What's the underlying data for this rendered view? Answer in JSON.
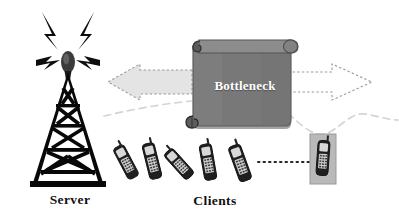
{
  "diagram": {
    "background_color": "#ffffff",
    "width": 399,
    "height": 216,
    "labels": {
      "server": "Server",
      "clients": "Clients",
      "bottleneck": "Bottleneck"
    },
    "colors": {
      "ink": "#101010",
      "scroll_fill": "#787878",
      "scroll_edge": "#606060",
      "scroll_roll": "#8a8a8a",
      "arrow_fill": "#e2e2e2",
      "arrow_stroke": "#8d8d8d",
      "arrow_open_fill": "#ffffff",
      "wave_line": "#d2d2d2",
      "dotted_line": "#2a2a2a",
      "label_white": "#ffffff",
      "phone_body": "#2b2b2b",
      "phone_light": "#cfcfcf"
    },
    "nodes": [
      {
        "id": "server-tower",
        "name": "radio-tower-icon",
        "label": "Server",
        "role": "server",
        "cx": 68,
        "cy": 115
      },
      {
        "id": "bottleneck-scroll",
        "name": "bottleneck-scroll",
        "label": "Bottleneck",
        "role": "constraint",
        "x": 192,
        "y": 40,
        "width": 98,
        "height": 88
      }
    ],
    "arrows": [
      {
        "id": "arrow-left",
        "name": "arrow-left-filled",
        "direction": "left",
        "style": "filled-dotted-outline",
        "meaning": "downstream traffic toward server"
      },
      {
        "id": "arrow-right",
        "name": "arrow-right-outline",
        "direction": "right",
        "style": "outline-dashed",
        "meaning": "upstream traffic toward clients"
      }
    ],
    "clients": {
      "count": 6,
      "label": "Clients",
      "items": [
        {
          "id": "phone-1",
          "name": "mobile-phone-1",
          "x": 126,
          "y": 160,
          "rotation": -28
        },
        {
          "id": "phone-2",
          "name": "mobile-phone-2",
          "x": 152,
          "y": 160,
          "rotation": -16
        },
        {
          "id": "phone-3",
          "name": "mobile-phone-3",
          "x": 178,
          "y": 163,
          "rotation": -40
        },
        {
          "id": "phone-4",
          "name": "mobile-phone-4",
          "x": 208,
          "y": 162,
          "rotation": -12
        },
        {
          "id": "phone-5",
          "name": "mobile-phone-5",
          "x": 240,
          "y": 162,
          "rotation": -22
        },
        {
          "id": "phone-6",
          "name": "mobile-phone-6-boxed",
          "x": 322,
          "y": 158,
          "rotation": 0,
          "boxed": true
        }
      ],
      "ellipsis_connector": {
        "name": "dotted-connector",
        "style": "dotted",
        "from_x": 258,
        "to_x": 312,
        "y": 162
      }
    },
    "decorations": {
      "radio_waves": {
        "name": "radio-wave-bolts",
        "count": 4
      },
      "wavy_line_left": {
        "name": "wavy-dashed-line-left"
      },
      "wavy_line_right": {
        "name": "wavy-dashed-line-right"
      }
    }
  }
}
